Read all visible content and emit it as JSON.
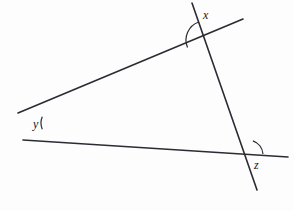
{
  "figure": {
    "type": "geometry-diagram",
    "background_color": "#fdfdfd",
    "stroke_color": "#2b2b33",
    "stroke_width": 1.6,
    "width": 294,
    "height": 211
  },
  "lines": [
    {
      "name": "line-upper-left-to-lower-right",
      "x1": 18,
      "y1": 113,
      "x2": 243,
      "y2": 19
    },
    {
      "name": "line-lower-left-to-right",
      "x1": 23,
      "y1": 140,
      "x2": 288,
      "y2": 157
    },
    {
      "name": "line-steep-top-to-bottom",
      "x1": 192,
      "y1": 3,
      "x2": 257,
      "y2": 190
    }
  ],
  "vertices": [
    {
      "name": "vertex-x-top",
      "x": 205,
      "y": 40
    },
    {
      "name": "vertex-y-left",
      "x": 57,
      "y": 123
    },
    {
      "name": "vertex-z-bottom-right",
      "x": 248,
      "y": 155
    }
  ],
  "angle_arcs": [
    {
      "name": "arc-x",
      "vertex_x": 205,
      "vertex_y": 40,
      "radius": 19,
      "start_angle_deg": 109,
      "end_angle_deg": 203
    },
    {
      "name": "arc-y",
      "vertex_x": 57,
      "vertex_y": 123,
      "radius": 16,
      "start_angle_deg": 157,
      "end_angle_deg": 203
    },
    {
      "name": "arc-z",
      "vertex_x": 248,
      "vertex_y": 155,
      "radius": 15,
      "start_angle_deg": 4,
      "end_angle_deg": 71
    }
  ],
  "labels": {
    "x": {
      "text": "x",
      "left": 203,
      "top": 9
    },
    "y": {
      "text": "y",
      "left": 33,
      "top": 118
    },
    "z": {
      "text": "z",
      "left": 254,
      "top": 159
    }
  }
}
